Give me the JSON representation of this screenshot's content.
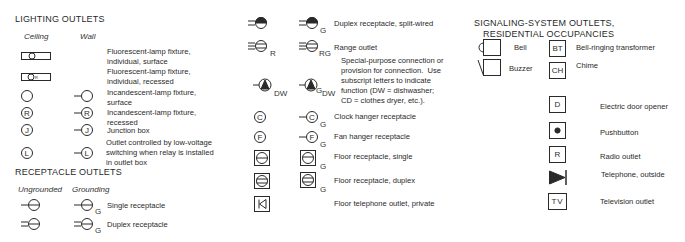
{
  "lighting": {
    "title": "LIGHTING OUTLETS",
    "col_ceiling": "Ceiling",
    "col_wall": "Wall",
    "items": [
      {
        "symbol": "fluorescent-surface",
        "label": "Fluorescent-lamp fixture,\nindividual, surface"
      },
      {
        "symbol": "fluorescent-recessed",
        "label": "Fluorescent-lamp fixture,\nindividual, recessed"
      },
      {
        "symbol": "incandescent-surface",
        "label": "Incandescent-lamp fixture,\nsurface"
      },
      {
        "symbol": "incandescent-recessed",
        "letter": "R",
        "label": "Incandescent-lamp fixture,\nrecessed"
      },
      {
        "symbol": "junction-box",
        "letter": "J",
        "label": "Junction box"
      },
      {
        "symbol": "low-voltage",
        "letter": "L",
        "label": "Outlet controlled by low-voltage\nswitching when relay is installed\nin outlet box"
      }
    ]
  },
  "receptacle": {
    "title": "RECEPTACLE OUTLETS",
    "col_ungrounded": "Ungrounded",
    "col_grounding": "Grounding",
    "ground_letter": "G",
    "items": [
      {
        "symbol": "single",
        "label": "Single receptacle"
      },
      {
        "symbol": "duplex",
        "label": "Duplex receptacle"
      }
    ]
  },
  "middle": {
    "items": [
      {
        "symbol": "duplex-split",
        "label": "Duplex receptacle, split-wired",
        "sub_g": "G"
      },
      {
        "symbol": "range",
        "label": "Range outlet",
        "sub_u": "R",
        "sub_g": "RG"
      },
      {
        "symbol": "special-purpose",
        "label": "Special-purpose connection or\nprovision for connection.  Use\nsubscript letters to indicate\nfunction (DW = dishwasher;\nCD = clothes dryer, etc.).",
        "sub_u": "DW",
        "sub_g1": "G",
        "sub_g2": "DW"
      },
      {
        "symbol": "clock-hanger",
        "letter": "C",
        "label": "Clock hanger receptacle",
        "sub_g": "G"
      },
      {
        "symbol": "fan-hanger",
        "letter": "F",
        "label": "Fan hanger receptacle",
        "sub_g": "G"
      },
      {
        "symbol": "floor-single",
        "label": "Floor receptacle, single",
        "sub_g": "G"
      },
      {
        "symbol": "floor-duplex",
        "label": "Floor receptacle, duplex",
        "sub_g": "G"
      },
      {
        "symbol": "floor-telephone",
        "label": "Floor telephone outlet, private"
      }
    ]
  },
  "signaling": {
    "title_line1": "SIGNALING-SYSTEM OUTLETS,",
    "title_line2": "RESIDENTIAL OCCUPANCIES",
    "items": [
      {
        "symbol": "bell",
        "label": "Bell"
      },
      {
        "symbol": "buzzer",
        "label": "Buzzer"
      },
      {
        "symbol": "bell-transformer",
        "code": "BT",
        "label": "Bell-ringing transformer"
      },
      {
        "symbol": "chime",
        "code": "CH",
        "label": "Chime"
      },
      {
        "symbol": "door-opener",
        "code": "D",
        "label": "Electric door opener"
      },
      {
        "symbol": "pushbutton",
        "label": "Pushbutton"
      },
      {
        "symbol": "radio",
        "code": "R",
        "label": "Radio outlet"
      },
      {
        "symbol": "telephone-outside",
        "label": "Telephone, outside"
      },
      {
        "symbol": "television",
        "code": "TV",
        "label": "Television outlet"
      }
    ]
  }
}
